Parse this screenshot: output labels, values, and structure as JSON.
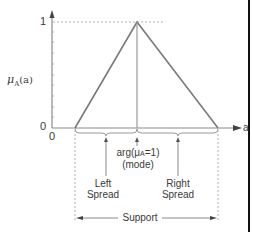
{
  "diagram": {
    "y_axis": {
      "label_main": "μ",
      "label_sub": "A",
      "label_arg": "(a)",
      "tick_top": "1",
      "tick_origin": "0"
    },
    "x_axis": {
      "label": "a",
      "origin": "0"
    },
    "annotations": {
      "mode_line1_prefix": "arg(μ",
      "mode_line1_sub": "A",
      "mode_line1_suffix": "=1)",
      "mode_line2": "(mode)",
      "left_spread_line1": "Left",
      "left_spread_line2": "Spread",
      "right_spread_line1": "Right",
      "right_spread_line2": "Spread",
      "support": "Support"
    },
    "shape": {
      "type": "triangle",
      "left_base_x": 75,
      "peak_x": 137,
      "right_base_x": 218,
      "baseline_y": 128,
      "peak_y": 22
    },
    "colors": {
      "line": "#7a7a7a",
      "axis": "#8a8a8a",
      "dotted": "#b0b0b0",
      "border": "#111111"
    }
  }
}
